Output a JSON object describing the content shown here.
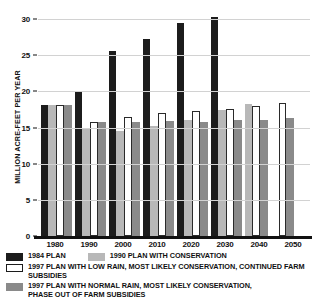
{
  "chart_data": {
    "type": "bar",
    "title": "",
    "xlabel": "",
    "ylabel": "MILLION ACRE-FEET PER YEAR",
    "ylim": [
      0,
      30
    ],
    "yticks": [
      0,
      5,
      10,
      15,
      20,
      25,
      30
    ],
    "ytick_labels": [
      "0",
      "5",
      "10",
      "15",
      "20",
      "25",
      "30"
    ],
    "grid": true,
    "legend_position": "bottom-left",
    "categories": [
      "1980",
      "1990",
      "2000",
      "2010",
      "2020",
      "2030",
      "2040",
      "2050"
    ],
    "series": [
      {
        "name": "1984 PLAN",
        "color": "#1c1c1c",
        "values": [
          18.1,
          19.9,
          25.6,
          27.2,
          29.5,
          30.3,
          null,
          null
        ]
      },
      {
        "name": "1990 PLAN WITH CONSERVATION",
        "color": "#b8b8b8",
        "values": [
          18.1,
          14.9,
          14.5,
          15.2,
          16.1,
          17.4,
          18.3,
          null
        ]
      },
      {
        "name": "1997 PLAN WITH LOW RAIN, MOST LIKELY CONSERVATION, CONTINUED FARM SUBSIDIES",
        "color": "#ffffff",
        "values": [
          18.1,
          15.7,
          16.5,
          17.0,
          17.3,
          17.6,
          18.0,
          18.4
        ]
      },
      {
        "name": "1997 PLAN WITH NORMAL RAIN, MOST LIKELY CONSERVATION,\nPHASE OUT OF FARM SUBSIDIES",
        "color": "#8a8a8a",
        "values": [
          18.1,
          15.7,
          15.8,
          15.9,
          15.8,
          16.0,
          16.1,
          16.3
        ]
      }
    ]
  },
  "axis": {
    "y_title": "MILLION ACRE-FEET PER YEAR"
  },
  "legend": {
    "items": [
      {
        "label": "1984 PLAN",
        "swatch": "s0"
      },
      {
        "label": "1990 PLAN WITH CONSERVATION",
        "swatch": "s1"
      },
      {
        "label": "1997 PLAN WITH LOW RAIN, MOST LIKELY CONSERVATION, CONTINUED FARM SUBSIDIES",
        "swatch": "s2"
      },
      {
        "label": "1997 PLAN WITH NORMAL RAIN, MOST LIKELY CONSERVATION,\nPHASE OUT OF FARM SUBSIDIES",
        "swatch": "s3"
      }
    ]
  }
}
